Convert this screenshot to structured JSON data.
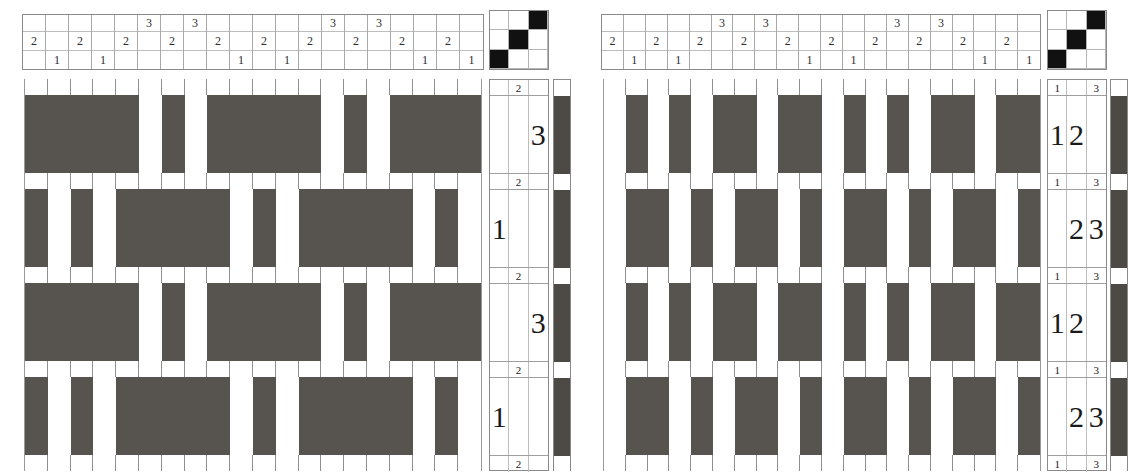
{
  "meta": {
    "colors": {
      "warp_dark": "#57544f",
      "weft_dark": "#4d4a46",
      "tieup_on": "#111111",
      "grid_line": "#9a9a9a",
      "background": "#ffffff"
    }
  },
  "drafts": [
    {
      "id": "left-draft",
      "name": "Left draft",
      "threading": {
        "rows": 3,
        "row_labels": [
          "shaft-3",
          "shaft-2",
          "shaft-1"
        ],
        "columns": [
          {
            "shaft": "2",
            "cells": [
              "",
              "2",
              ""
            ]
          },
          {
            "shaft": "1",
            "cells": [
              "",
              "",
              "1"
            ]
          },
          {
            "shaft": "2",
            "cells": [
              "",
              "2",
              ""
            ]
          },
          {
            "shaft": "1",
            "cells": [
              "",
              "",
              "1"
            ]
          },
          {
            "shaft": "2",
            "cells": [
              "",
              "2",
              ""
            ]
          },
          {
            "shaft": "3",
            "cells": [
              "3",
              "",
              ""
            ]
          },
          {
            "shaft": "2",
            "cells": [
              "",
              "2",
              ""
            ]
          },
          {
            "shaft": "3",
            "cells": [
              "3",
              "",
              ""
            ]
          },
          {
            "shaft": "2",
            "cells": [
              "",
              "2",
              ""
            ]
          },
          {
            "shaft": "1",
            "cells": [
              "",
              "",
              "1"
            ]
          },
          {
            "shaft": "2",
            "cells": [
              "",
              "2",
              ""
            ]
          },
          {
            "shaft": "1",
            "cells": [
              "",
              "",
              "1"
            ]
          },
          {
            "shaft": "2",
            "cells": [
              "",
              "2",
              ""
            ]
          },
          {
            "shaft": "3",
            "cells": [
              "3",
              "",
              ""
            ]
          },
          {
            "shaft": "2",
            "cells": [
              "",
              "2",
              ""
            ]
          },
          {
            "shaft": "3",
            "cells": [
              "3",
              "",
              ""
            ]
          },
          {
            "shaft": "2",
            "cells": [
              "",
              "2",
              ""
            ]
          },
          {
            "shaft": "1",
            "cells": [
              "",
              "",
              "1"
            ]
          },
          {
            "shaft": "2",
            "cells": [
              "",
              "2",
              ""
            ]
          },
          {
            "shaft": "1",
            "cells": [
              "",
              "",
              "1"
            ]
          }
        ]
      },
      "tieup": {
        "size": 3,
        "grid": [
          [
            0,
            0,
            1
          ],
          [
            0,
            1,
            0
          ],
          [
            1,
            0,
            0
          ]
        ]
      },
      "treadling": {
        "columns": 3,
        "rows": [
          {
            "height": "thin",
            "cells": [
              "",
              "2",
              ""
            ]
          },
          {
            "height": "tall",
            "cells": [
              "",
              "",
              "3"
            ]
          },
          {
            "height": "thin",
            "cells": [
              "",
              "2",
              ""
            ]
          },
          {
            "height": "tall",
            "cells": [
              "1",
              "",
              ""
            ]
          },
          {
            "height": "thin",
            "cells": [
              "",
              "2",
              ""
            ]
          },
          {
            "height": "tall",
            "cells": [
              "",
              "",
              "3"
            ]
          },
          {
            "height": "thin",
            "cells": [
              "",
              "2",
              ""
            ]
          },
          {
            "height": "tall",
            "cells": [
              "1",
              "",
              ""
            ]
          },
          {
            "height": "thin",
            "cells": [
              "",
              "2",
              ""
            ]
          }
        ]
      },
      "weft_colors": [
        "light",
        "dark",
        "light",
        "dark",
        "light",
        "dark",
        "light",
        "dark",
        "light"
      ],
      "drawdown": {
        "warp_ends": 20,
        "picks": 9,
        "rows": [
          {
            "height": "thin",
            "cells": [
              "L",
              "L",
              "L",
              "L",
              "L",
              "L",
              "L",
              "L",
              "L",
              "L",
              "L",
              "L",
              "L",
              "L",
              "L",
              "L",
              "L",
              "L",
              "L",
              "L"
            ]
          },
          {
            "height": "tall",
            "cells": [
              "D",
              "D",
              "D",
              "D",
              "D",
              "L",
              "D",
              "L",
              "D",
              "D",
              "D",
              "D",
              "D",
              "L",
              "D",
              "L",
              "D",
              "D",
              "D",
              "D"
            ]
          },
          {
            "height": "thin",
            "cells": [
              "L",
              "L",
              "L",
              "L",
              "L",
              "L",
              "L",
              "L",
              "L",
              "L",
              "L",
              "L",
              "L",
              "L",
              "L",
              "L",
              "L",
              "L",
              "L",
              "L"
            ]
          },
          {
            "height": "tall",
            "cells": [
              "D",
              "L",
              "D",
              "L",
              "D",
              "D",
              "D",
              "D",
              "D",
              "L",
              "D",
              "L",
              "D",
              "D",
              "D",
              "D",
              "D",
              "L",
              "D",
              "L"
            ]
          },
          {
            "height": "thin",
            "cells": [
              "L",
              "L",
              "L",
              "L",
              "L",
              "L",
              "L",
              "L",
              "L",
              "L",
              "L",
              "L",
              "L",
              "L",
              "L",
              "L",
              "L",
              "L",
              "L",
              "L"
            ]
          },
          {
            "height": "tall",
            "cells": [
              "D",
              "D",
              "D",
              "D",
              "D",
              "L",
              "D",
              "L",
              "D",
              "D",
              "D",
              "D",
              "D",
              "L",
              "D",
              "L",
              "D",
              "D",
              "D",
              "D"
            ]
          },
          {
            "height": "thin",
            "cells": [
              "L",
              "L",
              "L",
              "L",
              "L",
              "L",
              "L",
              "L",
              "L",
              "L",
              "L",
              "L",
              "L",
              "L",
              "L",
              "L",
              "L",
              "L",
              "L",
              "L"
            ]
          },
          {
            "height": "tall",
            "cells": [
              "D",
              "L",
              "D",
              "L",
              "D",
              "D",
              "D",
              "D",
              "D",
              "L",
              "D",
              "L",
              "D",
              "D",
              "D",
              "D",
              "D",
              "L",
              "D",
              "L"
            ]
          },
          {
            "height": "thin",
            "cells": [
              "L",
              "L",
              "L",
              "L",
              "L",
              "L",
              "L",
              "L",
              "L",
              "L",
              "L",
              "L",
              "L",
              "L",
              "L",
              "L",
              "L",
              "L",
              "L",
              "L"
            ]
          }
        ]
      }
    },
    {
      "id": "right-draft",
      "name": "Right draft",
      "threading": {
        "rows": 3,
        "row_labels": [
          "shaft-3",
          "shaft-2",
          "shaft-1"
        ],
        "columns": [
          {
            "shaft": "2",
            "cells": [
              "",
              "2",
              ""
            ]
          },
          {
            "shaft": "1",
            "cells": [
              "",
              "",
              "1"
            ]
          },
          {
            "shaft": "2",
            "cells": [
              "",
              "2",
              ""
            ]
          },
          {
            "shaft": "1",
            "cells": [
              "",
              "",
              "1"
            ]
          },
          {
            "shaft": "2",
            "cells": [
              "",
              "2",
              ""
            ]
          },
          {
            "shaft": "3",
            "cells": [
              "3",
              "",
              ""
            ]
          },
          {
            "shaft": "2",
            "cells": [
              "",
              "2",
              ""
            ]
          },
          {
            "shaft": "3",
            "cells": [
              "3",
              "",
              ""
            ]
          },
          {
            "shaft": "2",
            "cells": [
              "",
              "2",
              ""
            ]
          },
          {
            "shaft": "1",
            "cells": [
              "",
              "",
              "1"
            ]
          },
          {
            "shaft": "2",
            "cells": [
              "",
              "2",
              ""
            ]
          },
          {
            "shaft": "1",
            "cells": [
              "",
              "",
              "1"
            ]
          },
          {
            "shaft": "2",
            "cells": [
              "",
              "2",
              ""
            ]
          },
          {
            "shaft": "3",
            "cells": [
              "3",
              "",
              ""
            ]
          },
          {
            "shaft": "2",
            "cells": [
              "",
              "2",
              ""
            ]
          },
          {
            "shaft": "3",
            "cells": [
              "3",
              "",
              ""
            ]
          },
          {
            "shaft": "2",
            "cells": [
              "",
              "2",
              ""
            ]
          },
          {
            "shaft": "1",
            "cells": [
              "",
              "",
              "1"
            ]
          },
          {
            "shaft": "2",
            "cells": [
              "",
              "2",
              ""
            ]
          },
          {
            "shaft": "1",
            "cells": [
              "",
              "",
              "1"
            ]
          }
        ]
      },
      "tieup": {
        "size": 3,
        "grid": [
          [
            0,
            0,
            1
          ],
          [
            0,
            1,
            0
          ],
          [
            1,
            0,
            0
          ]
        ]
      },
      "treadling": {
        "columns": 3,
        "rows": [
          {
            "height": "thin",
            "cells": [
              "1",
              "",
              "3"
            ]
          },
          {
            "height": "tall",
            "cells": [
              "1",
              "2",
              ""
            ]
          },
          {
            "height": "thin",
            "cells": [
              "1",
              "",
              "3"
            ]
          },
          {
            "height": "tall",
            "cells": [
              "",
              "2",
              "3"
            ]
          },
          {
            "height": "thin",
            "cells": [
              "1",
              "",
              "3"
            ]
          },
          {
            "height": "tall",
            "cells": [
              "1",
              "2",
              ""
            ]
          },
          {
            "height": "thin",
            "cells": [
              "1",
              "",
              "3"
            ]
          },
          {
            "height": "tall",
            "cells": [
              "",
              "2",
              "3"
            ]
          },
          {
            "height": "thin",
            "cells": [
              "1",
              "",
              "3"
            ]
          }
        ]
      },
      "weft_colors": [
        "light",
        "dark",
        "light",
        "dark",
        "light",
        "dark",
        "light",
        "dark",
        "light"
      ],
      "drawdown": {
        "warp_ends": 20,
        "picks": 9,
        "rows": [
          {
            "height": "thin",
            "cells": [
              "L",
              "L",
              "L",
              "L",
              "L",
              "L",
              "L",
              "L",
              "L",
              "L",
              "L",
              "L",
              "L",
              "L",
              "L",
              "L",
              "L",
              "L",
              "L",
              "L"
            ]
          },
          {
            "height": "tall",
            "cells": [
              "L",
              "D",
              "L",
              "D",
              "L",
              "D",
              "D",
              "L",
              "D",
              "D",
              "L",
              "D",
              "L",
              "D",
              "L",
              "D",
              "D",
              "L",
              "D",
              "D"
            ]
          },
          {
            "height": "thin",
            "cells": [
              "L",
              "L",
              "L",
              "L",
              "L",
              "L",
              "L",
              "L",
              "L",
              "L",
              "L",
              "L",
              "L",
              "L",
              "L",
              "L",
              "L",
              "L",
              "L",
              "L"
            ]
          },
          {
            "height": "tall",
            "cells": [
              "L",
              "D",
              "D",
              "L",
              "D",
              "L",
              "D",
              "D",
              "L",
              "D",
              "L",
              "D",
              "D",
              "L",
              "D",
              "L",
              "D",
              "D",
              "L",
              "D"
            ]
          },
          {
            "height": "thin",
            "cells": [
              "L",
              "L",
              "L",
              "L",
              "L",
              "L",
              "L",
              "L",
              "L",
              "L",
              "L",
              "L",
              "L",
              "L",
              "L",
              "L",
              "L",
              "L",
              "L",
              "L"
            ]
          },
          {
            "height": "tall",
            "cells": [
              "L",
              "D",
              "L",
              "D",
              "L",
              "D",
              "D",
              "L",
              "D",
              "D",
              "L",
              "D",
              "L",
              "D",
              "L",
              "D",
              "D",
              "L",
              "D",
              "D"
            ]
          },
          {
            "height": "thin",
            "cells": [
              "L",
              "L",
              "L",
              "L",
              "L",
              "L",
              "L",
              "L",
              "L",
              "L",
              "L",
              "L",
              "L",
              "L",
              "L",
              "L",
              "L",
              "L",
              "L",
              "L"
            ]
          },
          {
            "height": "tall",
            "cells": [
              "L",
              "D",
              "D",
              "L",
              "D",
              "L",
              "D",
              "D",
              "L",
              "D",
              "L",
              "D",
              "D",
              "L",
              "D",
              "L",
              "D",
              "D",
              "L",
              "D"
            ]
          },
          {
            "height": "thin",
            "cells": [
              "L",
              "L",
              "L",
              "L",
              "L",
              "L",
              "L",
              "L",
              "L",
              "L",
              "L",
              "L",
              "L",
              "L",
              "L",
              "L",
              "L",
              "L",
              "L",
              "L"
            ]
          }
        ]
      }
    }
  ]
}
